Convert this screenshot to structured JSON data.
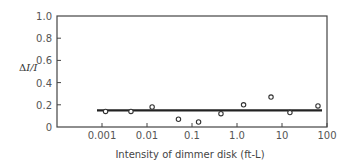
{
  "chart_data": {
    "type": "scatter",
    "title": "",
    "xlabel": "Intensity of dimmer disk (ft-L)",
    "ylabel": "ΔI/I",
    "xscale": "log",
    "xlim": [
      0.0005,
      100
    ],
    "ylim": [
      0,
      1.0
    ],
    "grid": false,
    "legend": null,
    "x_ticks": [
      0.001,
      0.01,
      0.1,
      1.0,
      10,
      100
    ],
    "x_tick_labels": [
      "0.001",
      "0.01",
      "0.1",
      "1.0",
      "10",
      "100"
    ],
    "y_ticks": [
      0,
      0.2,
      0.4,
      0.6,
      0.8,
      1.0
    ],
    "y_tick_labels": [
      "0",
      "0.2",
      "0.4",
      "0.6",
      "0.8",
      "1.0"
    ],
    "series": [
      {
        "name": "Measured ΔI/I",
        "marker": "open-circle",
        "x": [
          0.0012,
          0.0044,
          0.013,
          0.05,
          0.14,
          0.44,
          1.4,
          5.7,
          15,
          63
        ],
        "y": [
          0.14,
          0.14,
          0.18,
          0.07,
          0.045,
          0.12,
          0.2,
          0.27,
          0.13,
          0.19
        ]
      },
      {
        "name": "Weber fraction (constant)",
        "type": "line",
        "x": [
          0.0008,
          80
        ],
        "y": [
          0.15,
          0.15
        ]
      }
    ]
  },
  "labels": {
    "xlabel": "Intensity of dimmer disk (ft-L)",
    "ylabel_delta": "Δ",
    "ylabel_rest": "I/I"
  }
}
